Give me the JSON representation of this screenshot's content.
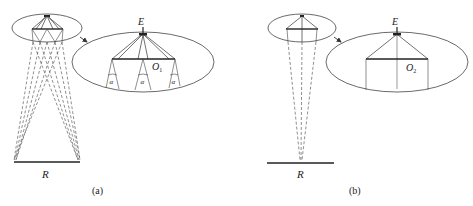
{
  "figure": {
    "panels": [
      {
        "id": "a",
        "caption": "(a)",
        "receiver_label": "R",
        "emitter_label": "E",
        "center_label": "O",
        "center_subscript": "1",
        "angle_label": "α",
        "angle_count": 3
      },
      {
        "id": "b",
        "caption": "(b)",
        "receiver_label": "R",
        "emitter_label": "E",
        "center_label": "O",
        "center_subscript": "2"
      }
    ]
  }
}
